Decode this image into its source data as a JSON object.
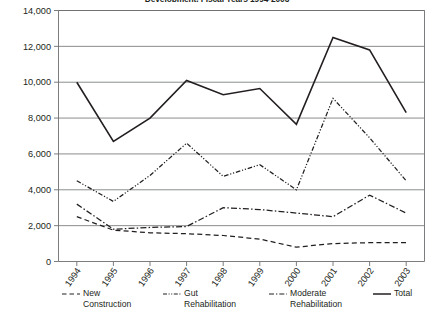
{
  "chart_data": {
    "type": "line",
    "title": "Development, Fiscal Years 1994-2003",
    "xlabel": "",
    "ylabel": "",
    "x": [
      "1994",
      "1995",
      "1996",
      "1997",
      "1998",
      "1999",
      "2000",
      "2001",
      "2002",
      "2003"
    ],
    "categories": [
      "1994",
      "1995",
      "1996",
      "1997",
      "1998",
      "1999",
      "2000",
      "2001",
      "2002",
      "2003"
    ],
    "ylim": [
      0,
      14000
    ],
    "ytick_values": [
      0,
      2000,
      4000,
      6000,
      8000,
      10000,
      12000,
      14000
    ],
    "ytick_labels": [
      "0",
      "2,000",
      "4,000",
      "6,000",
      "8,000",
      "10,000",
      "12,000",
      "14,000"
    ],
    "grid": true,
    "legend_position": "bottom",
    "series": [
      {
        "name": "New Construction",
        "legend_label": "New\nConstruction",
        "style": "dashed",
        "color": "#231f20",
        "values": [
          2500,
          1750,
          1600,
          1550,
          1450,
          1250,
          800,
          1000,
          1050,
          1050
        ]
      },
      {
        "name": "Gut Rehabilitation",
        "legend_label": "Gut\nRehabilitation",
        "style": "dash-dot-dot",
        "color": "#231f20",
        "values": [
          4500,
          3350,
          4800,
          6600,
          4750,
          5400,
          4000,
          9100,
          6900,
          4500
        ]
      },
      {
        "name": "Moderate Rehabilitation",
        "legend_label": "Moderate\nRehabilitation",
        "style": "dash-dot",
        "color": "#231f20",
        "values": [
          3200,
          1800,
          1900,
          1950,
          3000,
          2900,
          2700,
          2500,
          3700,
          2700
        ]
      },
      {
        "name": "Total",
        "legend_label": "Total",
        "style": "solid",
        "color": "#231f20",
        "values": [
          10000,
          6700,
          8000,
          10100,
          9300,
          9650,
          7650,
          12500,
          11800,
          8300
        ]
      }
    ]
  },
  "axis": {
    "ytick_labels": [
      "14,000",
      "12,000",
      "10,000",
      "8,000",
      "6,000",
      "4,000",
      "2,000",
      "0"
    ],
    "xtick_labels": [
      "1994",
      "1995",
      "1996",
      "1997",
      "1998",
      "1999",
      "2000",
      "2001",
      "2002",
      "2003"
    ]
  }
}
